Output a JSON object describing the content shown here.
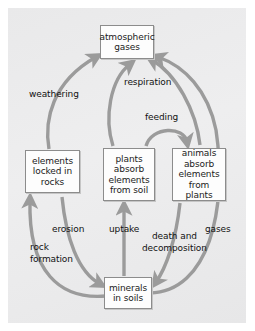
{
  "diagram": {
    "panel_color": "#ececed",
    "arrow_color": "#9b9b9b",
    "box_fill": "#fdfdfd",
    "box_border": "#8c8c8c",
    "text_color": "#1b1b1b",
    "nodes": [
      {
        "id": "atmospheric-gases",
        "label": "atmospheric\ngases"
      },
      {
        "id": "elements-locked-in-rocks",
        "label": "elements\nlocked in\nrocks"
      },
      {
        "id": "plants-absorb-elements-from-soil",
        "label": "plants\nabsorb\nelements\nfrom soil"
      },
      {
        "id": "animals-absorb-elements-from-plants",
        "label": "animals\nabsorb\nelements\nfrom plants"
      },
      {
        "id": "minerals-in-soils",
        "label": "minerals\nin soils"
      }
    ],
    "edges": [
      {
        "id": "weathering",
        "label": "weathering",
        "from": "elements-locked-in-rocks",
        "to": "atmospheric-gases"
      },
      {
        "id": "respiration",
        "label": "respiration",
        "from": "plants-absorb-elements-from-soil",
        "to": "atmospheric-gases"
      },
      {
        "id": "feeding",
        "label": "feeding",
        "from": "plants-absorb-elements-from-soil",
        "to": "animals-absorb-elements-from-plants"
      },
      {
        "id": "erosion",
        "label": "erosion",
        "from": "elements-locked-in-rocks",
        "to": "minerals-in-soils"
      },
      {
        "id": "rock-formation",
        "label": "rock\nformation",
        "from": "minerals-in-soils",
        "to": "elements-locked-in-rocks"
      },
      {
        "id": "uptake",
        "label": "uptake",
        "from": "minerals-in-soils",
        "to": "plants-absorb-elements-from-soil"
      },
      {
        "id": "death-and-decomposition",
        "label": "death and\ndecomposition",
        "from": "animals-absorb-elements-from-plants",
        "to": "minerals-in-soils"
      },
      {
        "id": "gases",
        "label": "gases",
        "from": "minerals-in-soils",
        "to": "atmospheric-gases"
      }
    ]
  }
}
